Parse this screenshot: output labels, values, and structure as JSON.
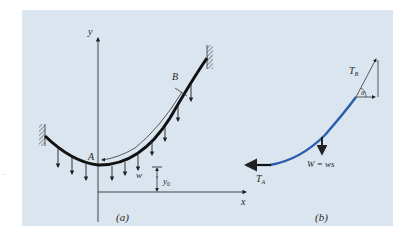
{
  "figure": {
    "background_color": "#dae5ef",
    "panel_a": {
      "caption": "(a)",
      "axis_y_label": "y",
      "axis_x_label": "x",
      "point_A_label": "A",
      "point_B_label": "B",
      "load_label": "w",
      "offset_label": "y",
      "offset_subscript": "0"
    },
    "panel_b": {
      "caption": "(b)",
      "tension_B_label": "T",
      "tension_B_subscript": "B",
      "angle_label": "θ",
      "tension_A_label": "T",
      "tension_A_subscript": "A",
      "weight_label": "W = ws",
      "cable_color": "#2a5db0"
    }
  }
}
